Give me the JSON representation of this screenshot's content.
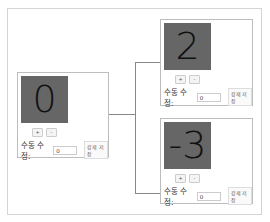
{
  "header": {
    "cutoff_text": ""
  },
  "panels": [
    {
      "id": "root",
      "value": "0",
      "plus": "+",
      "minus": "-",
      "label": "수동 수정:",
      "input_value": "0",
      "save_label": "강제 저장"
    },
    {
      "id": "child-top",
      "value": "2",
      "plus": "+",
      "minus": "-",
      "label": "수동 수정:",
      "input_value": "0",
      "save_label": "강제 저장"
    },
    {
      "id": "child-bottom",
      "value": "-3",
      "plus": "+",
      "minus": "-",
      "label": "수동 수정:",
      "input_value": "0",
      "save_label": "강제 저장"
    }
  ],
  "colors": {
    "display_bg": "#666666",
    "connector": "#888888",
    "border": "#bdbdbd"
  }
}
